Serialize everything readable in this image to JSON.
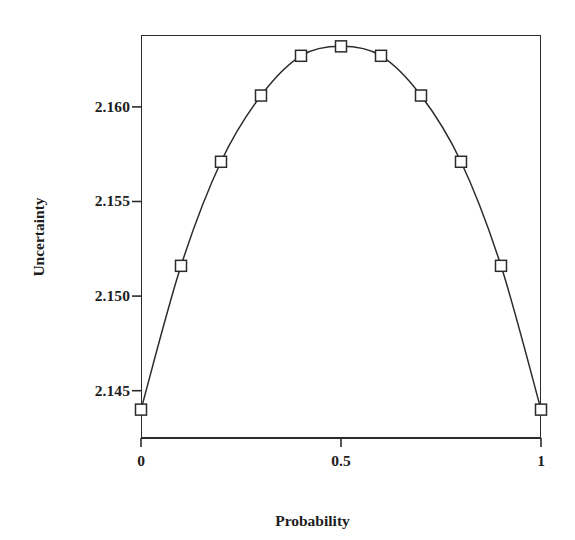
{
  "chart_data": {
    "type": "line",
    "title": "",
    "subtitle": "",
    "xlabel": "Probability",
    "ylabel": "Uncertainty",
    "xlim": [
      0,
      1
    ],
    "ylim": [
      2.1425,
      2.1638
    ],
    "grid": false,
    "legend": null,
    "legend_position": "none",
    "marker": "open-square",
    "line_style": "solid",
    "line_color": "#2b2b2b",
    "marker_edge_color": "#2b2b2b",
    "marker_face_color": "#ffffff",
    "x": [
      0,
      0.1,
      0.2,
      0.3,
      0.4,
      0.5,
      0.6,
      0.7,
      0.8,
      0.9,
      1
    ],
    "values": [
      2.144,
      2.1516,
      2.1571,
      2.1606,
      2.1627,
      2.1632,
      2.1627,
      2.1606,
      2.1571,
      2.1516,
      2.144
    ],
    "series": [
      {
        "name": "Uncertainty",
        "x": [
          0,
          0.1,
          0.2,
          0.3,
          0.4,
          0.5,
          0.6,
          0.7,
          0.8,
          0.9,
          1
        ],
        "values": [
          2.144,
          2.1516,
          2.1571,
          2.1606,
          2.1627,
          2.1632,
          2.1627,
          2.1606,
          2.1571,
          2.1516,
          2.144
        ]
      }
    ],
    "xticks": [
      {
        "value": 0,
        "label": "0"
      },
      {
        "value": 0.5,
        "label": "0.5"
      },
      {
        "value": 1,
        "label": "1"
      }
    ],
    "yticks": [
      {
        "value": 2.16,
        "label": "2.160"
      },
      {
        "value": 2.155,
        "label": "2.155"
      },
      {
        "value": 2.15,
        "label": "2.150"
      },
      {
        "value": 2.145,
        "label": "2.145"
      }
    ],
    "annotations": []
  },
  "axes": {
    "x_title": "Probability",
    "y_title": "Uncertainty"
  },
  "colors": {
    "line": "#2b2b2b",
    "axis": "#2b2b2b",
    "text": "#1d1d1d",
    "background": "#ffffff"
  }
}
